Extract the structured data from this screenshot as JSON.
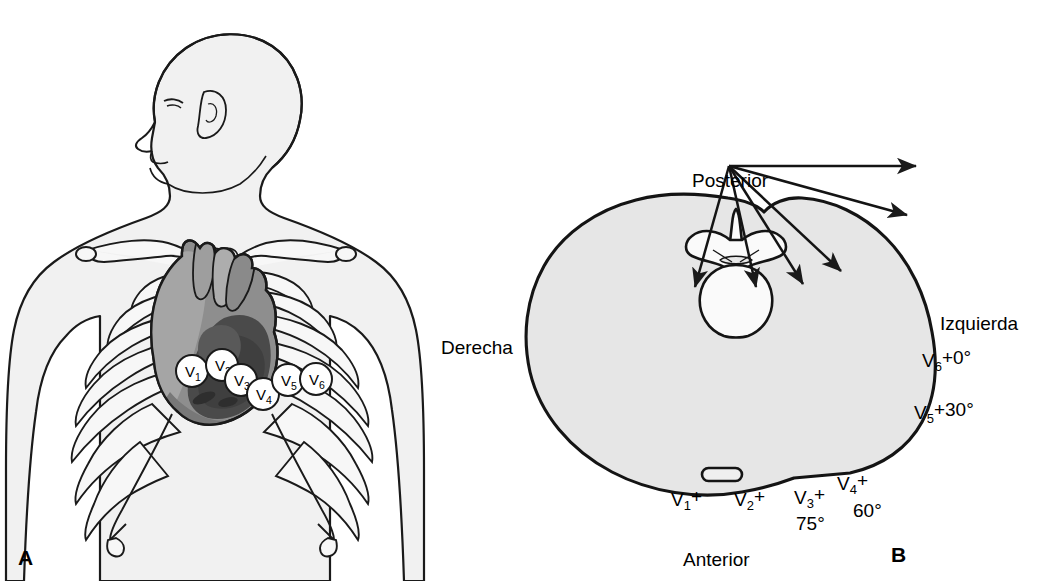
{
  "figure": {
    "type": "medical-diagram",
    "language": "es",
    "panels": [
      {
        "id": "A",
        "letter": "A",
        "title": "",
        "description": "anterior-chest-precordial-lead-placement",
        "electrodes": [
          {
            "name": "V",
            "index": "1",
            "label": "V1",
            "cx": 192,
            "cy": 371,
            "r": 16
          },
          {
            "name": "V",
            "index": "2",
            "label": "V2",
            "cx": 221,
            "cy": 366,
            "r": 16
          },
          {
            "name": "V",
            "index": "3",
            "label": "V3",
            "cx": 240,
            "cy": 379,
            "r": 16
          },
          {
            "name": "V",
            "index": "4",
            "label": "V4",
            "cx": 262,
            "cy": 393,
            "r": 16
          },
          {
            "name": "V",
            "index": "5",
            "label": "V5",
            "cx": 286,
            "cy": 380,
            "r": 16
          },
          {
            "name": "V",
            "index": "6",
            "label": "V6",
            "cx": 314,
            "cy": 379,
            "r": 16
          }
        ]
      },
      {
        "id": "B",
        "letter": "B",
        "title": "",
        "description": "transverse-thorax-cross-section-lead-vectors",
        "orientation_labels": {
          "posterior": "Posterior",
          "anterior": "Anterior",
          "derecha": "Derecha",
          "izquierda": "Izquierda"
        },
        "vectors": [
          {
            "lead": "V",
            "index": "1",
            "label": "V",
            "plus": "+",
            "angle_text": "",
            "tip_x": 695,
            "tip_y": 478
          },
          {
            "lead": "V",
            "index": "2",
            "label": "V",
            "plus": "+",
            "angle_text": "",
            "tip_x": 757,
            "tip_y": 478
          },
          {
            "lead": "V",
            "index": "3",
            "label": "V",
            "plus": "+",
            "angle_text": "75°",
            "tip_x": 803,
            "tip_y": 475
          },
          {
            "lead": "V",
            "index": "4",
            "label": "V",
            "plus": "+",
            "angle_text": "60°",
            "tip_x": 841,
            "tip_y": 462
          },
          {
            "lead": "V",
            "index": "5",
            "label": "V",
            "plus": "+30°",
            "angle_text": "",
            "tip_x": 908,
            "tip_y": 406
          },
          {
            "lead": "V",
            "index": "6",
            "label": "V",
            "plus": "+0°",
            "angle_text": "",
            "tip_x": 916,
            "tip_y": 354
          }
        ],
        "lead_labels": [
          {
            "id": "v1",
            "base": "V",
            "sub": "1",
            "sup": "+",
            "x": 672,
            "y": 489
          },
          {
            "id": "v2",
            "base": "V",
            "sub": "2",
            "sup": "+",
            "x": 735,
            "y": 489
          },
          {
            "id": "v3",
            "base": "V",
            "sub": "3",
            "sup": "+",
            "x": 794,
            "y": 487
          },
          {
            "id": "v4",
            "base": "V",
            "sub": "4",
            "sup": "+",
            "x": 838,
            "y": 474
          },
          {
            "id": "v5",
            "base": "V",
            "sub": "5",
            "sup": "+30°",
            "x": 915,
            "y": 404
          },
          {
            "id": "v6",
            "base": "V",
            "sub": "6",
            "sup": "+0°",
            "x": 923,
            "y": 351
          }
        ],
        "angle_labels": [
          {
            "id": "v3-angle",
            "text": "75°",
            "x": 797,
            "y": 511
          },
          {
            "id": "v4-angle",
            "text": "60°",
            "x": 852,
            "y": 500
          }
        ],
        "orientation_positions": {
          "posterior": {
            "x": 692,
            "y": 170
          },
          "anterior": {
            "x": 690,
            "y": 549
          },
          "derecha": {
            "x": 443,
            "y": 337
          },
          "izquierda": {
            "x": 941,
            "y": 313
          }
        },
        "vector_origin": {
          "x": 729,
          "y": 351
        }
      }
    ]
  },
  "colors": {
    "outline": "#111111",
    "body_fill": "#f0f0f0",
    "torso_fill": "#e3e3e3",
    "bone_fill": "#f5f5f5",
    "heart_light": "#a0a0a0",
    "heart_mid": "#8a8a8a",
    "heart_dark": "#4f4f4f",
    "electrode_fill": "#ffffff",
    "text": "#000000"
  }
}
